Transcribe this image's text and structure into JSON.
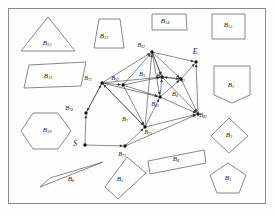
{
  "figure": {
    "type": "visibility-graph",
    "border_color": "#8a8a8a",
    "obstacle_stroke": "#7a7a7a",
    "edge_color": "#3a3a3a",
    "node_color": "#111111",
    "background": "#fefefe"
  },
  "start": {
    "label": "S",
    "x": 85,
    "y": 145
  },
  "end": {
    "label": "E",
    "x": 196,
    "y": 62
  },
  "obstacles": [
    {
      "id": "B1",
      "label": "B",
      "sub": "1",
      "shape": "home-pentagon",
      "label_x": 231,
      "label_y": 86,
      "points": "214,66 250,66 250,95 232,103 214,95"
    },
    {
      "id": "B2",
      "label": "B",
      "sub": "2",
      "shape": "diamond",
      "label_x": 229,
      "label_y": 136,
      "points": "229,118 248,136 229,153 211,136"
    },
    {
      "id": "B3",
      "label": "B",
      "sub": "3",
      "shape": "pentagon",
      "label_x": 228,
      "label_y": 179,
      "points": "228,163 246,175 239,193 217,193 210,175"
    },
    {
      "id": "B4",
      "label": "B",
      "sub": "4",
      "shape": "rotated-rectangle",
      "label_x": 176,
      "label_y": 160,
      "points": "148,161 204,150 206,163 150,174"
    },
    {
      "id": "B5",
      "label": "B",
      "sub": "5",
      "shape": "rotated-rectangle",
      "label_x": 120,
      "label_y": 180,
      "points": "127,157 146,173 118,199 105,187"
    },
    {
      "id": "B6",
      "label": "B",
      "sub": "6",
      "shape": "thin-triangle",
      "label_x": 71,
      "label_y": 180,
      "points": "40,187 103,162 50,178"
    },
    {
      "id": "B10",
      "label": "B",
      "sub": "10",
      "shape": "hexagon",
      "label_x": 47,
      "label_y": 131,
      "points": "33,113 58,113 71,131 58,149 33,149 21,131"
    },
    {
      "id": "B11",
      "label": "B",
      "sub": "11",
      "shape": "parallelogram",
      "label_x": 48,
      "label_y": 77,
      "points": "29,65 86,62 81,86 24,88"
    },
    {
      "id": "B12",
      "label": "B",
      "sub": "12",
      "shape": "triangle",
      "label_x": 47,
      "label_y": 44,
      "points": "48,17 75,51 21,51"
    },
    {
      "id": "B13",
      "label": "B",
      "sub": "13",
      "shape": "trapezoid",
      "label_x": 104,
      "label_y": 37,
      "points": "99,19 120,19 124,48 94,48"
    },
    {
      "id": "B14",
      "label": "B",
      "sub": "14",
      "shape": "quadrilateral",
      "label_x": 165,
      "label_y": 22,
      "points": "152,14 186,14 187,30 152,30"
    },
    {
      "id": "B15",
      "label": "B",
      "sub": "15",
      "shape": "square",
      "label_x": 228,
      "label_y": 26,
      "points": "212,14 245,14 245,39 212,39"
    }
  ],
  "nodes": [
    {
      "id": "B71",
      "label": "B",
      "sub": "71",
      "x": 102,
      "y": 83,
      "label_x": 88,
      "label_y": 79
    },
    {
      "id": "B72",
      "label": "B",
      "sub": "72",
      "x": 145,
      "y": 127,
      "label_x": 148,
      "label_y": 133
    },
    {
      "id": "B73",
      "label": "B",
      "sub": "73",
      "x": 125,
      "y": 146,
      "label_x": 122,
      "label_y": 155
    },
    {
      "id": "B74",
      "label": "B",
      "sub": "74",
      "x": 86,
      "y": 113,
      "label_x": 69,
      "label_y": 109
    },
    {
      "id": "B81",
      "label": "B",
      "sub": "81",
      "x": 198,
      "y": 114,
      "label_x": 203,
      "label_y": 116
    },
    {
      "id": "B82",
      "label": "B",
      "sub": "82",
      "x": 181,
      "y": 79,
      "label_x": 181,
      "label_y": 80
    },
    {
      "id": "B83",
      "label": "B",
      "sub": "83",
      "x": 160,
      "y": 97,
      "label_x": 155,
      "label_y": 105
    },
    {
      "id": "B91",
      "label": "B",
      "sub": "91",
      "x": 162,
      "y": 77,
      "label_x": 160,
      "label_y": 77
    },
    {
      "id": "B92",
      "label": "B",
      "sub": "92",
      "x": 152,
      "y": 52,
      "label_x": 141,
      "label_y": 46
    },
    {
      "id": "B93",
      "label": "B",
      "sub": "93",
      "x": 123,
      "y": 85,
      "label_x": 115,
      "label_y": 79
    }
  ],
  "region_labels": [
    {
      "id": "B7",
      "label": "B",
      "sub": "7",
      "x": 125,
      "y": 120
    },
    {
      "id": "B8",
      "label": "B",
      "sub": "8",
      "x": 175,
      "y": 95
    },
    {
      "id": "B9",
      "label": "B",
      "sub": "9",
      "x": 142,
      "y": 75
    }
  ],
  "edges": [
    [
      "S",
      "B74"
    ],
    [
      "S",
      "B73"
    ],
    [
      "B74",
      "B71"
    ],
    [
      "B73",
      "B72"
    ],
    [
      "B72",
      "B71"
    ],
    [
      "B71",
      "B93"
    ],
    [
      "B93",
      "B92"
    ],
    [
      "B92",
      "B91"
    ],
    [
      "B91",
      "B82"
    ],
    [
      "B82",
      "E"
    ],
    [
      "B71",
      "B92"
    ],
    [
      "B92",
      "E"
    ],
    [
      "B92",
      "B83"
    ],
    [
      "B92",
      "B82"
    ],
    [
      "B92",
      "B91"
    ],
    [
      "B71",
      "B83"
    ],
    [
      "B71",
      "B91"
    ],
    [
      "B71",
      "B72"
    ],
    [
      "B93",
      "B83"
    ],
    [
      "B93",
      "B91"
    ],
    [
      "B83",
      "B81"
    ],
    [
      "B83",
      "B82"
    ],
    [
      "B83",
      "B91"
    ],
    [
      "B82",
      "B81"
    ],
    [
      "B91",
      "B81"
    ],
    [
      "B72",
      "B83"
    ],
    [
      "B72",
      "B81"
    ],
    [
      "B72",
      "B92"
    ],
    [
      "B73",
      "B81"
    ],
    [
      "B81",
      "E"
    ],
    [
      "B82",
      "B91"
    ],
    [
      "B71",
      "B74"
    ],
    [
      "B93",
      "B72"
    ]
  ]
}
